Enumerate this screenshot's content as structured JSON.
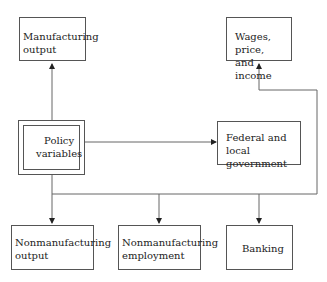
{
  "diagram": {
    "nodes": {
      "manufacturing_output": "Manufacturing\noutput",
      "wages": "Wages, price,\nand income",
      "policy": "Policy\nvariables",
      "government": "Federal and\nlocal government",
      "nonmanufacturing_output": "Nonmanufacturing\noutput",
      "nonmanufacturing_employment": "Nonmanufacturing\nemployment",
      "banking": "Banking"
    },
    "edges": [
      {
        "from": "policy",
        "to": "manufacturing_output"
      },
      {
        "from": "policy",
        "to": "government"
      },
      {
        "from": "policy",
        "to": "wages"
      },
      {
        "from": "policy",
        "to": "nonmanufacturing_output"
      },
      {
        "from": "policy",
        "to": "nonmanufacturing_employment"
      },
      {
        "from": "policy",
        "to": "banking"
      }
    ],
    "colors": {
      "line": "#555555",
      "text": "#222222"
    }
  }
}
